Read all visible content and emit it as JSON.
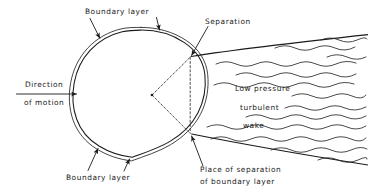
{
  "figure": {
    "background_color": "#ffffff",
    "ink_color": "#1a1a1a",
    "width": 368,
    "height": 188
  },
  "labels": {
    "boundary_layer_top": "Boundary layer",
    "boundary_layer_bottom": "Boundary layer",
    "separation": "Separation",
    "direction_line1": "Direction",
    "direction_line2": "of motion",
    "wake_line1": "Low pressure",
    "wake_line2": "turbulent",
    "wake_line3": "wake",
    "place_line1": "Place of separation",
    "place_line2": "of boundary layer"
  },
  "geometry": {
    "circle": {
      "cx": 141,
      "cy": 94,
      "r": 64
    },
    "boundary_layer_offset": 2.6,
    "center_vertex": {
      "x": 152,
      "y": 95
    },
    "separation_point_upper": {
      "x": 190,
      "y": 57
    },
    "separation_point_lower": {
      "x": 190,
      "y": 133
    },
    "motion_arrow": {
      "x_start": 77,
      "x_end": 12,
      "y": 94
    }
  },
  "icons": {
    "pointer_arrow": "arrow-head-icon",
    "motion_arrow": "left-arrow-icon",
    "center_marker": "center-dot-icon"
  }
}
